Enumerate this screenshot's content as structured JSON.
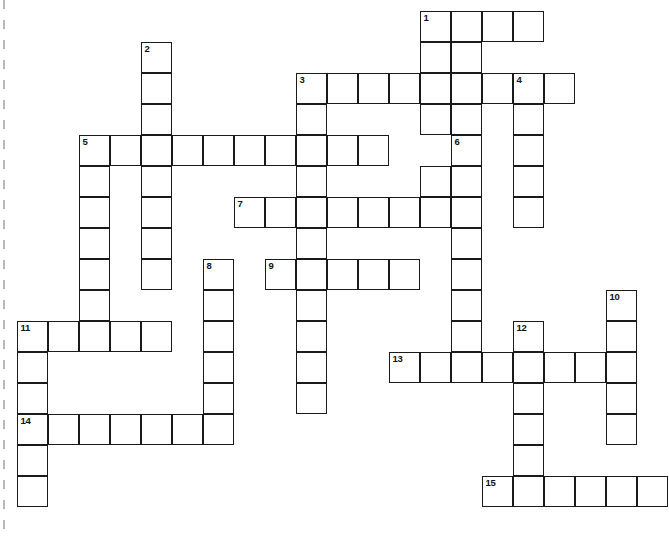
{
  "puzzle": {
    "kind": "crossword-grid",
    "title": "",
    "cell_size_px": 31,
    "grid_origin": {
      "x": 17,
      "y": 11
    },
    "columns": 20,
    "rows": 17,
    "colors": {
      "cell_fill": "#ffffff",
      "cell_border": "#1a1a1a",
      "number_text": "#111111",
      "page_background": "#ffffff",
      "page_edge_mark": "#b9b9b9"
    },
    "clue_numbers": [
      "1",
      "2",
      "3",
      "4",
      "5",
      "6",
      "7",
      "8",
      "9",
      "10",
      "11",
      "12",
      "13",
      "14",
      "15"
    ],
    "entries": [
      {
        "number": "1",
        "direction": "across",
        "length": 4,
        "start": {
          "col": 13,
          "row": 0
        }
      },
      {
        "number": "1",
        "direction": "down",
        "length": 5,
        "start": {
          "col": 13,
          "row": 0
        }
      },
      {
        "number": "2",
        "direction": "down",
        "length": 8,
        "start": {
          "col": 4,
          "row": 1
        }
      },
      {
        "number": "3",
        "direction": "across",
        "length": 9,
        "start": {
          "col": 9,
          "row": 2
        }
      },
      {
        "number": "3",
        "direction": "down",
        "length": 11,
        "start": {
          "col": 9,
          "row": 2
        }
      },
      {
        "number": "4",
        "direction": "down",
        "length": 5,
        "start": {
          "col": 16,
          "row": 2
        }
      },
      {
        "number": "5",
        "direction": "across",
        "length": 10,
        "start": {
          "col": 2,
          "row": 4
        }
      },
      {
        "number": "5",
        "direction": "down",
        "length": 5,
        "start": {
          "col": 2,
          "row": 4
        }
      },
      {
        "number": "6",
        "direction": "down",
        "length": 8,
        "start": {
          "col": 14,
          "row": 4
        }
      },
      {
        "number": "7",
        "direction": "across",
        "length": 8,
        "start": {
          "col": 7,
          "row": 6
        }
      },
      {
        "number": "8",
        "direction": "down",
        "length": 7,
        "start": {
          "col": 6,
          "row": 8
        }
      },
      {
        "number": "9",
        "direction": "across",
        "length": 5,
        "start": {
          "col": 8,
          "row": 8
        }
      },
      {
        "number": "10",
        "direction": "down",
        "length": 5,
        "start": {
          "col": 19,
          "row": 9
        }
      },
      {
        "number": "11",
        "direction": "across",
        "length": 5,
        "start": {
          "col": 0,
          "row": 10
        }
      },
      {
        "number": "11",
        "direction": "down",
        "length": 3,
        "start": {
          "col": 0,
          "row": 10
        }
      },
      {
        "number": "12",
        "direction": "down",
        "length": 6,
        "start": {
          "col": 16,
          "row": 10
        }
      },
      {
        "number": "13",
        "direction": "across",
        "length": 8,
        "start": {
          "col": 12,
          "row": 11
        }
      },
      {
        "number": "14",
        "direction": "across",
        "length": 7,
        "start": {
          "col": 0,
          "row": 13
        }
      },
      {
        "number": "14",
        "direction": "down",
        "length": 3,
        "start": {
          "col": 0,
          "row": 13
        }
      },
      {
        "number": "15",
        "direction": "across",
        "length": 6,
        "start": {
          "col": 15,
          "row": 15
        }
      }
    ],
    "cells": [
      {
        "col": 13,
        "row": 0,
        "number": "1"
      },
      {
        "col": 14,
        "row": 0
      },
      {
        "col": 15,
        "row": 0
      },
      {
        "col": 16,
        "row": 0
      },
      {
        "col": 4,
        "row": 1,
        "number": "2"
      },
      {
        "col": 13,
        "row": 1
      },
      {
        "col": 14,
        "row": 1
      },
      {
        "col": 4,
        "row": 2
      },
      {
        "col": 9,
        "row": 2,
        "number": "3"
      },
      {
        "col": 10,
        "row": 2
      },
      {
        "col": 11,
        "row": 2
      },
      {
        "col": 12,
        "row": 2
      },
      {
        "col": 13,
        "row": 2
      },
      {
        "col": 14,
        "row": 2
      },
      {
        "col": 15,
        "row": 2
      },
      {
        "col": 16,
        "row": 2,
        "number": "4"
      },
      {
        "col": 17,
        "row": 2
      },
      {
        "col": 4,
        "row": 3
      },
      {
        "col": 9,
        "row": 3
      },
      {
        "col": 13,
        "row": 3
      },
      {
        "col": 14,
        "row": 3
      },
      {
        "col": 16,
        "row": 3
      },
      {
        "col": 2,
        "row": 4,
        "number": "5"
      },
      {
        "col": 3,
        "row": 4
      },
      {
        "col": 4,
        "row": 4
      },
      {
        "col": 5,
        "row": 4
      },
      {
        "col": 6,
        "row": 4
      },
      {
        "col": 7,
        "row": 4
      },
      {
        "col": 8,
        "row": 4
      },
      {
        "col": 9,
        "row": 4
      },
      {
        "col": 10,
        "row": 4
      },
      {
        "col": 11,
        "row": 4
      },
      {
        "col": 14,
        "row": 4,
        "number": "6"
      },
      {
        "col": 16,
        "row": 4
      },
      {
        "col": 2,
        "row": 5
      },
      {
        "col": 4,
        "row": 5
      },
      {
        "col": 9,
        "row": 5
      },
      {
        "col": 13,
        "row": 5
      },
      {
        "col": 14,
        "row": 5
      },
      {
        "col": 16,
        "row": 5
      },
      {
        "col": 2,
        "row": 6
      },
      {
        "col": 4,
        "row": 6
      },
      {
        "col": 7,
        "row": 6,
        "number": "7"
      },
      {
        "col": 8,
        "row": 6
      },
      {
        "col": 9,
        "row": 6
      },
      {
        "col": 10,
        "row": 6
      },
      {
        "col": 11,
        "row": 6
      },
      {
        "col": 12,
        "row": 6
      },
      {
        "col": 13,
        "row": 6
      },
      {
        "col": 14,
        "row": 6
      },
      {
        "col": 16,
        "row": 6
      },
      {
        "col": 2,
        "row": 7
      },
      {
        "col": 4,
        "row": 7
      },
      {
        "col": 9,
        "row": 7
      },
      {
        "col": 14,
        "row": 7
      },
      {
        "col": 2,
        "row": 8
      },
      {
        "col": 4,
        "row": 8
      },
      {
        "col": 6,
        "row": 8,
        "number": "8"
      },
      {
        "col": 8,
        "row": 8,
        "number": "9"
      },
      {
        "col": 9,
        "row": 8
      },
      {
        "col": 10,
        "row": 8
      },
      {
        "col": 11,
        "row": 8
      },
      {
        "col": 12,
        "row": 8
      },
      {
        "col": 14,
        "row": 8
      },
      {
        "col": 2,
        "row": 9
      },
      {
        "col": 6,
        "row": 9
      },
      {
        "col": 9,
        "row": 9
      },
      {
        "col": 14,
        "row": 9
      },
      {
        "col": 19,
        "row": 9,
        "number": "10"
      },
      {
        "col": 0,
        "row": 10,
        "number": "11"
      },
      {
        "col": 1,
        "row": 10
      },
      {
        "col": 2,
        "row": 10
      },
      {
        "col": 3,
        "row": 10
      },
      {
        "col": 4,
        "row": 10
      },
      {
        "col": 6,
        "row": 10
      },
      {
        "col": 9,
        "row": 10
      },
      {
        "col": 14,
        "row": 10
      },
      {
        "col": 16,
        "row": 10,
        "number": "12"
      },
      {
        "col": 19,
        "row": 10
      },
      {
        "col": 0,
        "row": 11
      },
      {
        "col": 6,
        "row": 11
      },
      {
        "col": 9,
        "row": 11
      },
      {
        "col": 12,
        "row": 11,
        "number": "13"
      },
      {
        "col": 13,
        "row": 11
      },
      {
        "col": 14,
        "row": 11
      },
      {
        "col": 15,
        "row": 11
      },
      {
        "col": 16,
        "row": 11
      },
      {
        "col": 17,
        "row": 11
      },
      {
        "col": 18,
        "row": 11
      },
      {
        "col": 19,
        "row": 11
      },
      {
        "col": 0,
        "row": 12
      },
      {
        "col": 6,
        "row": 12
      },
      {
        "col": 9,
        "row": 12
      },
      {
        "col": 16,
        "row": 12
      },
      {
        "col": 19,
        "row": 12
      },
      {
        "col": 0,
        "row": 13,
        "number": "14"
      },
      {
        "col": 1,
        "row": 13
      },
      {
        "col": 2,
        "row": 13
      },
      {
        "col": 3,
        "row": 13
      },
      {
        "col": 4,
        "row": 13
      },
      {
        "col": 5,
        "row": 13
      },
      {
        "col": 6,
        "row": 13
      },
      {
        "col": 16,
        "row": 13
      },
      {
        "col": 19,
        "row": 13
      },
      {
        "col": 0,
        "row": 14
      },
      {
        "col": 16,
        "row": 14
      },
      {
        "col": 0,
        "row": 15
      },
      {
        "col": 15,
        "row": 15,
        "number": "15"
      },
      {
        "col": 16,
        "row": 15
      },
      {
        "col": 17,
        "row": 15
      },
      {
        "col": 18,
        "row": 15
      },
      {
        "col": 19,
        "row": 15
      },
      {
        "col": 20,
        "row": 15
      }
    ]
  }
}
